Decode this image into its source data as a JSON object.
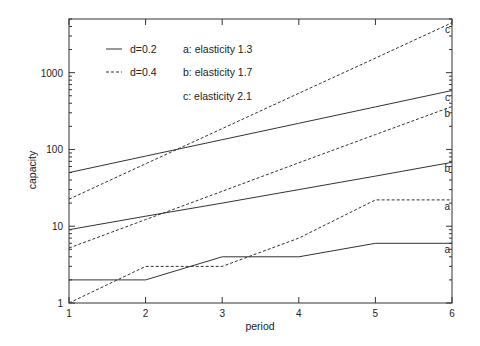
{
  "chart_data": {
    "type": "line",
    "title": "",
    "xlabel": "period",
    "ylabel": "capacity",
    "x": [
      1,
      2,
      3,
      4,
      5,
      6
    ],
    "xlim": [
      1,
      6
    ],
    "ylim": [
      1,
      5000
    ],
    "yscale": "log",
    "xticks": [
      "1",
      "2",
      "3",
      "4",
      "5",
      "6"
    ],
    "yticks": [
      "1",
      "10",
      "100",
      "1000"
    ],
    "grid": false,
    "legend_position": "upper-left inside",
    "legend": {
      "line_styles": [
        {
          "label": "d=0.2",
          "style": "solid"
        },
        {
          "label": "d=0.4",
          "style": "dashed"
        }
      ],
      "series_keys": [
        {
          "label": "a: elasticity 1.3"
        },
        {
          "label": "b: elasticity 1.7"
        },
        {
          "label": "c: elasticity 2.1"
        }
      ]
    },
    "series": [
      {
        "name": "a, d=0.2",
        "end_label": "a",
        "style": "solid",
        "values": [
          2,
          2,
          4,
          4,
          6,
          6
        ]
      },
      {
        "name": "a, d=0.4",
        "end_label": "a",
        "style": "dashed",
        "values": [
          1,
          3,
          3,
          7,
          22,
          22
        ]
      },
      {
        "name": "b, d=0.2",
        "end_label": "b",
        "style": "solid",
        "values": [
          9,
          13.5,
          20,
          30,
          45,
          68
        ]
      },
      {
        "name": "b, d=0.4",
        "end_label": "b",
        "style": "dashed",
        "values": [
          5.2,
          12.2,
          28.5,
          67,
          156,
          362
        ]
      },
      {
        "name": "c, d=0.2",
        "end_label": "c",
        "style": "solid",
        "values": [
          50,
          82,
          134,
          219,
          358,
          585
        ]
      },
      {
        "name": "c, d=0.4",
        "end_label": "c",
        "style": "dashed",
        "values": [
          22.5,
          65,
          187,
          538,
          1550,
          4470
        ]
      }
    ],
    "colors": {
      "line": "#333333",
      "axis": "#333333",
      "background": "#ffffff"
    }
  }
}
